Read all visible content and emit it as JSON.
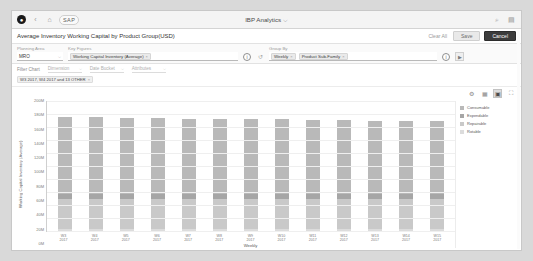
{
  "shell": {
    "logo_glyph": "●",
    "back_icon": "‹",
    "home_icon": "⌂",
    "brand": "SAP",
    "app_title": "IBP Analytics",
    "app_title_caret": "⌵",
    "search_icon": "⌕",
    "user_icon": "▤"
  },
  "title_bar": {
    "page_title": "Average Inventory Working Capital by Product Group(USD)",
    "clear_all_label": "Clear All",
    "save_label": "Save",
    "cancel_label": "Cancel"
  },
  "filter_bar": {
    "planning_area": {
      "label": "Planning Area",
      "value": "MRO",
      "caret": "⌵"
    },
    "key_figures": {
      "label": "Key Figures",
      "tokens": [
        {
          "text": "Working Capital Inventory (Average)",
          "remove": "×"
        }
      ],
      "info_icon": "i",
      "history_icon": "↺"
    },
    "group_by": {
      "label": "Group By",
      "tokens": [
        {
          "text": "Weekly",
          "remove": "×"
        },
        {
          "text": "Product Sub-Family",
          "remove": "×"
        }
      ],
      "info_icon": "i",
      "go_label": "▶"
    }
  },
  "chart_filter": {
    "label": "Filter Chart",
    "dropdowns": [
      {
        "text": "Dimension",
        "caret": "⌵"
      },
      {
        "text": "Date Bucket",
        "caret": "⌵"
      },
      {
        "text": "Attributes",
        "caret": "⌵"
      }
    ],
    "chips": [
      {
        "text": "W3 2017, W4 2017 and 13 OTHER",
        "remove": "×"
      }
    ]
  },
  "chart_toolbar": {
    "items": [
      {
        "name": "settings-icon",
        "glyph": "⚙",
        "active": false
      },
      {
        "name": "table-view-icon",
        "glyph": "▦",
        "active": false
      },
      {
        "name": "bar-chart-icon",
        "glyph": "▣",
        "active": true
      },
      {
        "name": "fullscreen-icon",
        "glyph": "⛶",
        "active": false
      }
    ]
  },
  "chart_data": {
    "type": "bar",
    "stacked": true,
    "title": "Average Inventory Working Capital by Product Group(USD)",
    "xlabel": "Weekly",
    "ylabel": "Working Capital Inventory (Average)",
    "categories": [
      "W3 2017",
      "W4 2017",
      "W5 2017",
      "W6 2017",
      "W7 2017",
      "W8 2017",
      "W9 2017",
      "W10 2017",
      "W11 2017",
      "W12 2017",
      "W13 2017",
      "W14 2017",
      "W15 2017"
    ],
    "ylim": [
      0,
      200000000
    ],
    "ytick_labels": [
      "200M",
      "180M",
      "160M",
      "140M",
      "120M",
      "100M",
      "80M",
      "60M",
      "40M",
      "20M",
      "0M"
    ],
    "ytick_values": [
      200000000,
      180000000,
      160000000,
      140000000,
      120000000,
      100000000,
      80000000,
      60000000,
      40000000,
      20000000,
      0
    ],
    "grid": true,
    "legend_position": "right",
    "series": [
      {
        "name": "Consumable",
        "color": "#b9b9b9",
        "values": [
          118000000,
          118000000,
          117000000,
          117000000,
          116000000,
          116000000,
          115000000,
          115000000,
          114000000,
          114000000,
          113000000,
          113000000,
          112000000
        ]
      },
      {
        "name": "Expendable",
        "color": "#a6a6a6",
        "values": [
          8000000,
          8000000,
          8000000,
          8000000,
          8000000,
          8000000,
          8000000,
          8000000,
          8000000,
          8000000,
          8000000,
          8000000,
          8000000
        ]
      },
      {
        "name": "Repairable",
        "color": "#c9c9c9",
        "values": [
          46000000,
          46000000,
          46000000,
          46000000,
          46000000,
          46000000,
          46000000,
          46000000,
          46000000,
          46000000,
          46000000,
          46000000,
          46000000
        ]
      },
      {
        "name": "Rotable",
        "color": "#dcdcdc",
        "values": [
          3000000,
          3000000,
          3000000,
          3000000,
          3000000,
          3000000,
          3000000,
          3000000,
          3000000,
          3000000,
          3000000,
          3000000,
          3000000
        ]
      }
    ]
  }
}
